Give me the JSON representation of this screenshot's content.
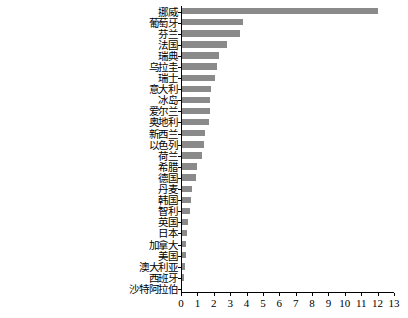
{
  "chart_data": {
    "type": "bar",
    "orientation": "horizontal",
    "title": "",
    "subtitle": "",
    "xlabel": "",
    "ylabel": "",
    "xlim": [
      0,
      13
    ],
    "grid": false,
    "legend": null,
    "bar_color": "#8a8a8a",
    "axis_color": "#000000",
    "background_color": "#ffffff",
    "xticks": [
      0,
      1,
      2,
      3,
      4,
      5,
      6,
      7,
      8,
      9,
      10,
      11,
      12,
      13
    ],
    "xticklabels": [
      "0",
      "1",
      "2",
      "3",
      "4",
      "5",
      "6",
      "7",
      "8",
      "9",
      "10",
      "11",
      "12",
      "13"
    ],
    "categories": [
      "挪威",
      "葡萄牙",
      "芬兰",
      "法国",
      "瑞典",
      "乌拉圭",
      "瑞士",
      "意大利",
      "冰岛",
      "爱尔兰",
      "奥地利",
      "新西兰",
      "以色列",
      "荷兰",
      "希腊",
      "德国",
      "丹麦",
      "韩国",
      "智利",
      "英国",
      "日本",
      "加拿大",
      "美国",
      "澳大利亚",
      "西班牙",
      "沙特阿拉伯"
    ],
    "values": [
      12.0,
      3.8,
      3.6,
      2.8,
      2.3,
      2.2,
      2.1,
      1.85,
      1.8,
      1.75,
      1.7,
      1.45,
      1.4,
      1.3,
      1.0,
      0.9,
      0.7,
      0.6,
      0.55,
      0.45,
      0.35,
      0.3,
      0.3,
      0.25,
      0.2,
      0.08
    ]
  }
}
